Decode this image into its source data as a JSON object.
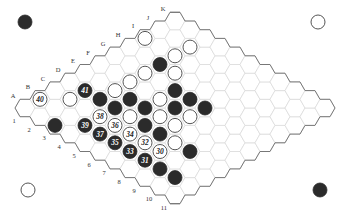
{
  "game": "Hex",
  "board": {
    "size": 11,
    "columns": [
      "A",
      "B",
      "C",
      "D",
      "E",
      "F",
      "G",
      "H",
      "I",
      "J",
      "K"
    ],
    "rows": [
      "1",
      "2",
      "3",
      "4",
      "5",
      "6",
      "7",
      "8",
      "9",
      "10",
      "11"
    ],
    "colors": {
      "black_stone": "#2b2b2b",
      "white_stone": "#ffffff",
      "cell_line": "#d9d9d9",
      "edge_line": "#777777"
    }
  },
  "corner_markers": [
    {
      "position": "top-left",
      "color": "black"
    },
    {
      "position": "top-right",
      "color": "white"
    },
    {
      "position": "bottom-left",
      "color": "white"
    },
    {
      "position": "bottom-right",
      "color": "black"
    }
  ],
  "stones": [
    {
      "cell": "I1",
      "color": "white",
      "label": ""
    },
    {
      "cell": "J3",
      "color": "white",
      "label": ""
    },
    {
      "cell": "I3",
      "color": "white",
      "label": ""
    },
    {
      "cell": "H3",
      "color": "black",
      "label": ""
    },
    {
      "cell": "H4",
      "color": "white",
      "label": ""
    },
    {
      "cell": "G3",
      "color": "white",
      "label": ""
    },
    {
      "cell": "F3",
      "color": "white",
      "label": ""
    },
    {
      "cell": "E3",
      "color": "white",
      "label": ""
    },
    {
      "cell": "G5",
      "color": "black",
      "label": ""
    },
    {
      "cell": "G6",
      "color": "black",
      "label": ""
    },
    {
      "cell": "G7",
      "color": "black",
      "label": ""
    },
    {
      "cell": "F5",
      "color": "white",
      "label": ""
    },
    {
      "cell": "F6",
      "color": "black",
      "label": ""
    },
    {
      "cell": "F7",
      "color": "white",
      "label": ""
    },
    {
      "cell": "E4",
      "color": "black",
      "label": ""
    },
    {
      "cell": "E5",
      "color": "black",
      "label": ""
    },
    {
      "cell": "E6",
      "color": "white",
      "label": ""
    },
    {
      "cell": "E7",
      "color": "white",
      "label": ""
    },
    {
      "cell": "D2",
      "color": "black",
      "label": "41"
    },
    {
      "cell": "D3",
      "color": "black",
      "label": ""
    },
    {
      "cell": "D4",
      "color": "black",
      "label": ""
    },
    {
      "cell": "D5",
      "color": "white",
      "label": ""
    },
    {
      "cell": "D6",
      "color": "black",
      "label": ""
    },
    {
      "cell": "D7",
      "color": "black",
      "label": ""
    },
    {
      "cell": "D8",
      "color": "white",
      "label": ""
    },
    {
      "cell": "D9",
      "color": "black",
      "label": ""
    },
    {
      "cell": "C2",
      "color": "white",
      "label": ""
    },
    {
      "cell": "C4",
      "color": "white",
      "label": "38"
    },
    {
      "cell": "C5",
      "color": "white",
      "label": "36"
    },
    {
      "cell": "C6",
      "color": "white",
      "label": "34"
    },
    {
      "cell": "C7",
      "color": "white",
      "label": "32"
    },
    {
      "cell": "C8",
      "color": "white",
      "label": "30"
    },
    {
      "cell": "B1",
      "color": "white",
      "label": "40"
    },
    {
      "cell": "B4",
      "color": "black",
      "label": "39"
    },
    {
      "cell": "B5",
      "color": "black",
      "label": "37"
    },
    {
      "cell": "B6",
      "color": "black",
      "label": "35"
    },
    {
      "cell": "B7",
      "color": "black",
      "label": "33"
    },
    {
      "cell": "B8",
      "color": "black",
      "label": "31"
    },
    {
      "cell": "B9",
      "color": "black",
      "label": ""
    },
    {
      "cell": "B10",
      "color": "black",
      "label": ""
    },
    {
      "cell": "A3",
      "color": "black",
      "label": ""
    }
  ]
}
